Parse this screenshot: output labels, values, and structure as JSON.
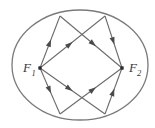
{
  "figure": {
    "type": "geometry-diagram",
    "background_color": "#ffffff",
    "stroke_color": "#6b6b6b",
    "label_color": "#3a3a3a",
    "width": 155,
    "height": 128
  },
  "labels": {
    "focus1": {
      "base": "F",
      "sub": "1",
      "x": 22,
      "y": 72
    },
    "focus2": {
      "base": "F",
      "sub": "2",
      "x": 129,
      "y": 72
    }
  },
  "ellipse": {
    "cx": 80,
    "cy": 65,
    "rx": 68,
    "ry": 55,
    "stroke": "#7a7a7a",
    "stroke_width": 1.3,
    "fill": "none"
  },
  "foci": [
    {
      "name": "F1",
      "x": 40,
      "y": 68,
      "dot_size": 3.4
    },
    {
      "name": "F2",
      "x": 122,
      "y": 68,
      "dot_size": 3.4
    }
  ],
  "reflection_points": [
    {
      "name": "top-left",
      "x": 60,
      "y": 16
    },
    {
      "name": "top-right",
      "x": 105,
      "y": 16
    },
    {
      "name": "bottom-right",
      "x": 105,
      "y": 114
    },
    {
      "name": "bottom-left",
      "x": 60,
      "y": 114
    }
  ],
  "rays": [
    {
      "name": "f1-to-top-left",
      "from": [
        40,
        68
      ],
      "to": [
        60,
        16
      ],
      "arrow_at": 0.55,
      "direction": "outbound"
    },
    {
      "name": "top-left-to-f2",
      "from": [
        60,
        16
      ],
      "to": [
        122,
        68
      ],
      "arrow_at": 0.58,
      "direction": "inbound"
    },
    {
      "name": "f1-to-top-right",
      "from": [
        40,
        68
      ],
      "to": [
        105,
        16
      ],
      "arrow_at": 0.5,
      "direction": "outbound"
    },
    {
      "name": "top-right-to-f2",
      "from": [
        105,
        16
      ],
      "to": [
        122,
        68
      ],
      "arrow_at": 0.55,
      "direction": "inbound"
    },
    {
      "name": "f1-to-bottom-left",
      "from": [
        40,
        68
      ],
      "to": [
        60,
        114
      ],
      "arrow_at": 0.55,
      "direction": "outbound"
    },
    {
      "name": "bottom-left-to-f2",
      "from": [
        60,
        114
      ],
      "to": [
        122,
        68
      ],
      "arrow_at": 0.58,
      "direction": "inbound"
    },
    {
      "name": "f1-to-bottom-right",
      "from": [
        40,
        68
      ],
      "to": [
        105,
        114
      ],
      "arrow_at": 0.5,
      "direction": "outbound"
    },
    {
      "name": "bottom-right-to-f2",
      "from": [
        105,
        114
      ],
      "to": [
        122,
        68
      ],
      "arrow_at": 0.55,
      "direction": "inbound"
    }
  ],
  "arrow": {
    "length": 7.5,
    "half_width": 2.6,
    "fill": "#4a4a4a"
  }
}
